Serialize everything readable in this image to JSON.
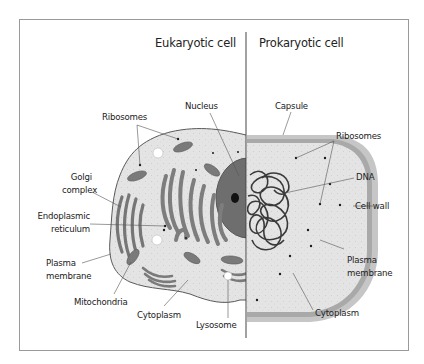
{
  "diagram": {
    "panels": [
      {
        "id": "eukaryotic",
        "title": "Eukaryotic cell"
      },
      {
        "id": "prokaryotic",
        "title": "Prokaryotic cell"
      }
    ],
    "eukaryotic_labels": {
      "ribosomes": "Ribosomes",
      "nucleus": "Nucleus",
      "golgi_line1": "Golgi",
      "golgi_line2": "complex",
      "er_line1": "Endoplasmic",
      "er_line2": "reticulum",
      "plasma_line1": "Plasma",
      "plasma_line2": "membrane",
      "mitochondria": "Mitochondria",
      "cytoplasm": "Cytoplasm",
      "lysosome": "Lysosome"
    },
    "prokaryotic_labels": {
      "capsule": "Capsule",
      "ribosomes": "Ribosomes",
      "dna": "DNA",
      "cell_wall": "Cell wall",
      "plasma_line1": "Plasma",
      "plasma_line2": "membrane",
      "cytoplasm": "Cytoplasm"
    },
    "colors": {
      "cytoplasm": "#e3e3e3",
      "organelle": "#7a7a7a",
      "nucleus": "#6b6b6b",
      "capsule": "#c4c4c4",
      "cell_wall": "#a8a8a8",
      "frame": "#9a9a9a",
      "leader": "#555555"
    }
  }
}
